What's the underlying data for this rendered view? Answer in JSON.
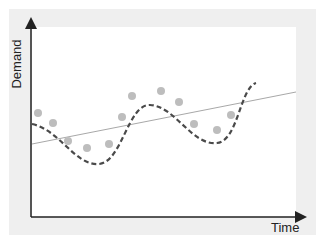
{
  "chart_data": {
    "type": "scatter",
    "title": "",
    "xlabel": "Time",
    "ylabel": "Demand",
    "grid": false,
    "legend": null,
    "axis_ticks": "none",
    "series": [
      {
        "name": "observed demand",
        "kind": "scatter",
        "color": "#bdbdbd",
        "points_px": [
          [
            38,
            113
          ],
          [
            53,
            123
          ],
          [
            68,
            141
          ],
          [
            87,
            148
          ],
          [
            109,
            144
          ],
          [
            122,
            117
          ],
          [
            132,
            96
          ],
          [
            161,
            91
          ],
          [
            179,
            102
          ],
          [
            194,
            124
          ],
          [
            217,
            130
          ],
          [
            231,
            115
          ]
        ]
      },
      {
        "name": "linear trend",
        "kind": "line",
        "color": "#a8a8a8",
        "points_px": [
          [
            32,
            144
          ],
          [
            296,
            92
          ]
        ]
      },
      {
        "name": "cyclical fit",
        "kind": "dashed-curve",
        "color": "#4a4a4a",
        "points_px": [
          [
            32,
            124
          ],
          [
            99,
            164
          ],
          [
            150,
            105
          ],
          [
            217,
            143
          ],
          [
            256,
            83
          ]
        ]
      }
    ]
  },
  "labels": {
    "y_axis": "Demand",
    "x_axis": "Time"
  }
}
